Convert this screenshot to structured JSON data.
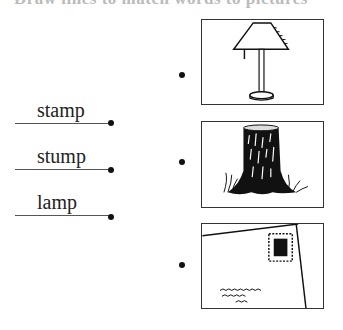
{
  "header": {
    "cropped_title": "Draw lines to match words to pictures"
  },
  "words": [
    {
      "label": "stamp"
    },
    {
      "label": "stump"
    },
    {
      "label": "lamp"
    }
  ],
  "pictures": [
    {
      "name": "lamp",
      "alt": "table lamp"
    },
    {
      "name": "stump",
      "alt": "tree stump"
    },
    {
      "name": "stamp",
      "alt": "envelope with stamp"
    }
  ]
}
